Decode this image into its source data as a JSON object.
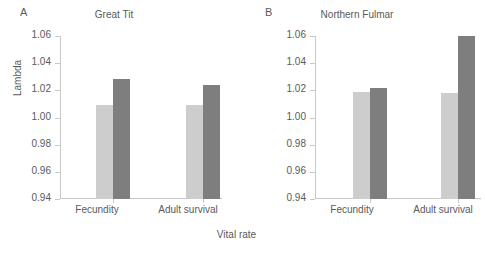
{
  "figure": {
    "xlabel_shared": "Vital rate",
    "ylabel": "Lambda",
    "colors": {
      "series_light": "#cdcdcd",
      "series_dark": "#7e7e7e",
      "axis": "#c8c8c8",
      "text": "#5a5a5a",
      "background": "#ffffff"
    }
  },
  "chart_data": [
    {
      "type": "bar",
      "panel_letter": "A",
      "title": "Great Tit",
      "xlabel": "Vital rate",
      "ylabel": "Lambda",
      "categories": [
        "Fecundity",
        "Adult survival"
      ],
      "ylim": [
        0.94,
        1.06
      ],
      "yticks": [
        "0.94",
        "0.96",
        "0.98",
        "1.00",
        "1.02",
        "1.04",
        "1.06"
      ],
      "ytick_values": [
        0.94,
        0.96,
        0.98,
        1.0,
        1.02,
        1.04,
        1.06
      ],
      "grid": false,
      "legend": "none",
      "series": [
        {
          "name": "light",
          "values": [
            1.009,
            1.009
          ]
        },
        {
          "name": "dark",
          "values": [
            1.0285,
            1.0237
          ]
        }
      ]
    },
    {
      "type": "bar",
      "panel_letter": "B",
      "title": "Northern Fulmar",
      "xlabel": "Vital rate",
      "ylabel": "Lambda",
      "categories": [
        "Fecundity",
        "Adult survival"
      ],
      "ylim": [
        0.94,
        1.06
      ],
      "yticks": [
        "0.94",
        "0.96",
        "0.98",
        "1.00",
        "1.02",
        "1.04",
        "1.06"
      ],
      "ytick_values": [
        0.94,
        0.96,
        0.98,
        1.0,
        1.02,
        1.04,
        1.06
      ],
      "grid": false,
      "legend": "none",
      "series": [
        {
          "name": "light",
          "values": [
            1.0185,
            1.018
          ]
        },
        {
          "name": "dark",
          "values": [
            1.0215,
            1.06
          ]
        }
      ]
    }
  ]
}
